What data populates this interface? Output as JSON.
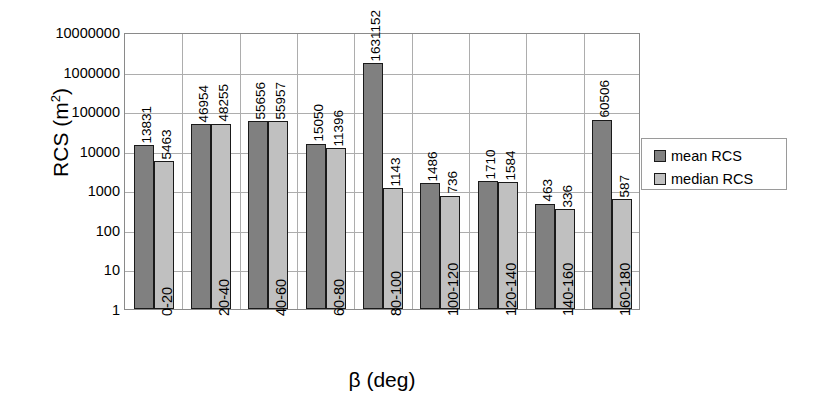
{
  "chart_data": {
    "type": "bar",
    "title": "",
    "xlabel": "β (deg)",
    "ylabel": "RCS (m²)",
    "ylabel_base": "RCS (m",
    "ylabel_sup": "2",
    "ylabel_tail": ")",
    "yscale": "log",
    "ylim": [
      1,
      10000000
    ],
    "grid": true,
    "legend_position": "right",
    "categories": [
      "0-20",
      "20-40",
      "40-60",
      "60-80",
      "80-100",
      "100-120",
      "120-140",
      "140-160",
      "160-180"
    ],
    "ytick_labels": [
      "10000000",
      "1000000",
      "100000",
      "10000",
      "1000",
      "100",
      "10",
      "1"
    ],
    "ytick_values": [
      10000000,
      1000000,
      100000,
      10000,
      1000,
      100,
      10,
      1
    ],
    "series": [
      {
        "name": "mean RCS",
        "color": "#808080",
        "values": [
          13831,
          46954,
          55656,
          15050,
          1631152,
          1486,
          1710,
          463,
          60506
        ],
        "labels": [
          "13831",
          "46954",
          "55656",
          "15050",
          "1631152",
          "1486",
          "1710",
          "463",
          "60506"
        ]
      },
      {
        "name": "median RCS",
        "color": "#c0c0c0",
        "values": [
          5463,
          48255,
          55957,
          11396,
          1143,
          736,
          1584,
          336,
          587
        ],
        "labels": [
          "5463",
          "48255",
          "55957",
          "11396",
          "1143",
          "736",
          "1584",
          "336",
          "587"
        ]
      }
    ]
  },
  "legend": {
    "entries": [
      {
        "label": "mean RCS",
        "color": "#808080"
      },
      {
        "label": "median RCS",
        "color": "#c0c0c0"
      }
    ]
  }
}
